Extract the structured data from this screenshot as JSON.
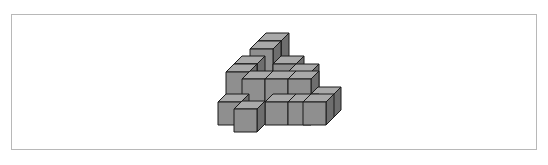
{
  "figure": {
    "cube_size": 23,
    "depth_dx": 8,
    "depth_dy": -8,
    "colors": {
      "front": "#8f8f8f",
      "top": "#a9a9a9",
      "side": "#6e6e6e",
      "edge": "#1a1a1a",
      "frame": "#b8b8b8"
    },
    "cubes": [
      {
        "x": 258,
        "y": 41,
        "note": "top layer back"
      },
      {
        "x": 250,
        "y": 49,
        "note": "top layer front"
      },
      {
        "x": 234,
        "y": 64,
        "note": "layer 2 back-left"
      },
      {
        "x": 273,
        "y": 64,
        "note": "layer 2 back-right"
      },
      {
        "x": 226,
        "y": 72,
        "note": "layer 2 mid-left"
      },
      {
        "x": 288,
        "y": 72,
        "note": "layer 2 mid-right back"
      },
      {
        "x": 242,
        "y": 79,
        "note": "layer 2 front-left"
      },
      {
        "x": 265,
        "y": 79,
        "note": "layer 2 front-center"
      },
      {
        "x": 288,
        "y": 79,
        "note": "layer 2 front-right"
      },
      {
        "x": 310,
        "y": 95,
        "note": "bottom far-right back"
      },
      {
        "x": 218,
        "y": 102,
        "note": "bottom left"
      },
      {
        "x": 265,
        "y": 102,
        "note": "bottom center"
      },
      {
        "x": 288,
        "y": 102,
        "note": "bottom center-right"
      },
      {
        "x": 303,
        "y": 102,
        "note": "bottom right"
      },
      {
        "x": 234,
        "y": 109,
        "note": "bottom front-left (protruding)"
      }
    ]
  }
}
